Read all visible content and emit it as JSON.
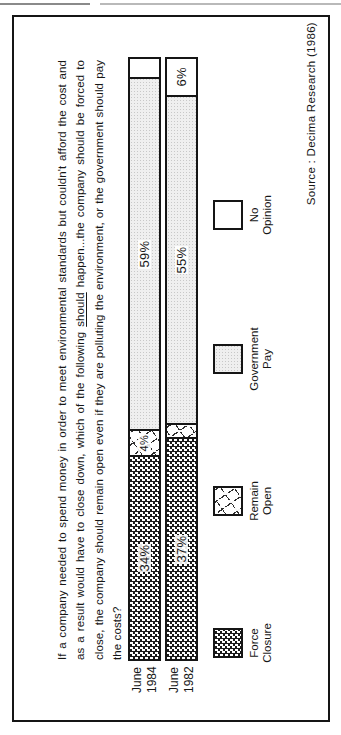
{
  "chart_data": {
    "type": "bar",
    "subtype": "horizontal_stacked_percentage",
    "question": "If a company needed to spend money in order to meet environmental standards but couldn't afford the cost and as a result would have to close down, which of the following should happen...the company should be forced to close, the company should remain open even if they are polluting the environment, or the government should pay the costs?",
    "underlined_word": "should",
    "categories": [
      "June 1984",
      "June 1982"
    ],
    "series": [
      {
        "name": "Force Closure",
        "values": [
          34,
          37
        ]
      },
      {
        "name": "Remain Open",
        "values": [
          4,
          2
        ]
      },
      {
        "name": "Government Pay",
        "values": [
          59,
          55
        ]
      },
      {
        "name": "No Opinion",
        "values": [
          3,
          6
        ]
      }
    ],
    "value_labels": [
      [
        "34%",
        "4%",
        "59%",
        ""
      ],
      [
        "37%",
        "",
        "55%",
        "6%"
      ]
    ],
    "xlim": [
      0,
      100
    ],
    "legend_position": "bottom",
    "source": "Source : Decima Research (1986)"
  },
  "question": {
    "line1": "If a company needed to spend money in order to meet environmental standards but couldn't afford the cost and",
    "line2_pre": "as a result would have to close down, which of the following ",
    "line2_underline": "should",
    "line2_post": " happen...the company should be forced to",
    "line3": "close, the company should remain open even if they are polluting the environment, or the government should pay",
    "line4": "the costs?"
  },
  "rows": [
    {
      "label_line1": "June",
      "label_line2": "1984"
    },
    {
      "label_line1": "June",
      "label_line2": "1982"
    }
  ],
  "legend": [
    {
      "line1": "Force",
      "line2": "Closure"
    },
    {
      "line1": "Remain",
      "line2": "Open"
    },
    {
      "line1": "Government",
      "line2": "Pay"
    },
    {
      "line1": "No",
      "line2": "Opinion"
    }
  ],
  "source_label": "Source : Decima Research (1986)"
}
